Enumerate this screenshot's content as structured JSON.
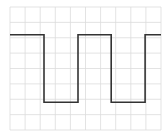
{
  "label": "",
  "chart_data": {
    "type": "line",
    "title": "",
    "xlabel": "",
    "ylabel": "",
    "grid": true,
    "grid_divisions": {
      "x": 10,
      "y": 8
    },
    "x": [
      0,
      2.25,
      2.25,
      4.5,
      4.5,
      6.7,
      6.7,
      8.95,
      8.95,
      10
    ],
    "y": [
      6.2,
      6.2,
      1.8,
      1.8,
      6.2,
      6.2,
      1.8,
      1.8,
      6.2,
      6.2
    ],
    "xlim": [
      0,
      10
    ],
    "ylim": [
      0,
      8
    ],
    "colors": {
      "grid": "#dcdcdc",
      "wave": "#333333",
      "border": "#d6d6d6"
    }
  },
  "layout": {
    "left": 10,
    "top": 7,
    "width": 151,
    "height": 123
  }
}
